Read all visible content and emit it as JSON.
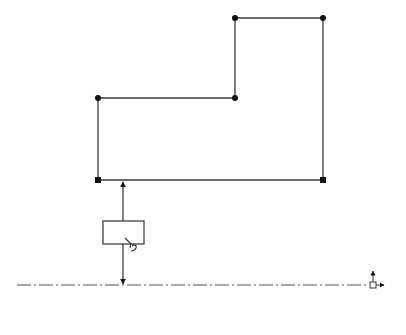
{
  "sketch": {
    "colors": {
      "line": "#3a3a3a",
      "point": "#111111",
      "centerline": "#555555",
      "background": "#ffffff"
    },
    "profile_points": [
      {
        "id": "p1",
        "x": 98,
        "y": 98,
        "marker": "dot"
      },
      {
        "id": "p2",
        "x": 235,
        "y": 98,
        "marker": "dot"
      },
      {
        "id": "p3",
        "x": 235,
        "y": 18,
        "marker": "dot"
      },
      {
        "id": "p4",
        "x": 323,
        "y": 18,
        "marker": "dot"
      },
      {
        "id": "p5",
        "x": 323,
        "y": 180,
        "marker": "square"
      },
      {
        "id": "p6",
        "x": 98,
        "y": 180,
        "marker": "square"
      }
    ],
    "dimension": {
      "x": 123,
      "from_y": 180,
      "to_y": 285,
      "value_box": {
        "x": 103,
        "y": 221,
        "width": 41,
        "height": 23,
        "value": ""
      },
      "edit_icon": "pencil-edit-icon"
    },
    "centerline": {
      "y": 285,
      "x_start": 17,
      "x_end": 370,
      "style": "dash-dot"
    },
    "origin": {
      "x": 373,
      "y": 285,
      "icon": "origin-axes-icon"
    }
  }
}
